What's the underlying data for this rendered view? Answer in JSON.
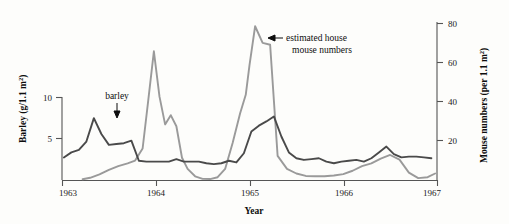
{
  "chart_data": {
    "type": "line",
    "title": "",
    "xlabel": "Year",
    "ylabel": "Barley (g/1.1 m2)",
    "ylabel_right": "Mouse numbers (per 1.1 m2)",
    "xlim": [
      1963.0,
      1967.0
    ],
    "ylim": [
      0,
      11
    ],
    "ylim_right": [
      0,
      88
    ],
    "grid": false,
    "legend": "none",
    "x_ticks": [
      "1963",
      "1964",
      "1965",
      "1966",
      "1967"
    ],
    "x_tick_values": [
      1963,
      1964,
      1965,
      1966,
      1967
    ],
    "y_ticks_left": [
      "5",
      "10"
    ],
    "y_tick_values_left": [
      5,
      10
    ],
    "y_ticks_right": [
      "20",
      "40",
      "60",
      "80"
    ],
    "y_tick_values_right": [
      20,
      40,
      60,
      80
    ],
    "series": [
      {
        "name": "barley",
        "axis": "left",
        "color": "#4a4a4a",
        "units": "g/1.1 m2",
        "x": [
          1963.02,
          1963.1,
          1963.18,
          1963.26,
          1963.34,
          1963.42,
          1963.5,
          1963.58,
          1963.66,
          1963.74,
          1963.82,
          1963.9,
          1963.98,
          1964.06,
          1964.14,
          1964.22,
          1964.3,
          1964.38,
          1964.46,
          1964.54,
          1964.62,
          1964.7,
          1964.78,
          1964.86,
          1964.94,
          1965.02,
          1965.1,
          1965.18,
          1965.26,
          1965.34,
          1965.42,
          1965.5,
          1965.58,
          1965.66,
          1965.74,
          1965.82,
          1965.9,
          1965.98,
          1966.06,
          1966.14,
          1966.22,
          1966.3,
          1966.38,
          1966.46,
          1966.54,
          1966.62,
          1966.7,
          1966.78,
          1966.86,
          1966.94
        ],
        "y": [
          2.7,
          3.3,
          3.6,
          4.6,
          7.4,
          5.5,
          4.2,
          4.3,
          4.4,
          4.7,
          2.3,
          2.2,
          2.2,
          2.2,
          2.2,
          2.5,
          2.2,
          2.2,
          2.2,
          2.0,
          1.9,
          2.0,
          2.3,
          2.1,
          3.2,
          5.8,
          6.5,
          7.0,
          7.6,
          5.2,
          3.3,
          2.6,
          2.4,
          2.5,
          2.6,
          2.2,
          2.0,
          2.2,
          2.3,
          2.4,
          2.2,
          2.6,
          3.3,
          4.0,
          3.1,
          2.7,
          2.8,
          2.8,
          2.7,
          2.6
        ]
      },
      {
        "name": "estimated house mouse numbers",
        "axis": "right",
        "color": "#9a9a9a",
        "units": "per 1.1 m2",
        "x": [
          1963.22,
          1963.3,
          1963.4,
          1963.5,
          1963.6,
          1963.7,
          1963.78,
          1963.86,
          1963.92,
          1963.98,
          1964.04,
          1964.1,
          1964.16,
          1964.22,
          1964.28,
          1964.34,
          1964.42,
          1964.5,
          1964.58,
          1964.66,
          1964.74,
          1964.82,
          1964.9,
          1964.96,
          1965.0,
          1965.06,
          1965.14,
          1965.22,
          1965.3,
          1965.4,
          1965.5,
          1965.6,
          1965.7,
          1965.8,
          1965.9,
          1966.0,
          1966.1,
          1966.2,
          1966.3,
          1966.4,
          1966.5,
          1966.6,
          1966.7,
          1966.8,
          1966.9,
          1966.98
        ],
        "y": [
          0.4,
          1.2,
          3.0,
          5.5,
          7.5,
          9.0,
          10.5,
          17.0,
          43.0,
          69.5,
          45.0,
          30.0,
          35.0,
          29.0,
          12.0,
          6.0,
          2.0,
          0.6,
          0.5,
          1.5,
          6.0,
          20.0,
          36.0,
          46.0,
          62.0,
          83.0,
          74.0,
          73.0,
          13.0,
          6.0,
          3.5,
          2.2,
          2.0,
          2.0,
          2.4,
          3.2,
          5.0,
          7.5,
          9.0,
          11.5,
          13.5,
          11.0,
          4.0,
          1.0,
          1.5,
          3.5
        ]
      }
    ],
    "annotations": [
      {
        "text": "barley",
        "target_series": "barley",
        "arrow": "down"
      },
      {
        "text_line1": "estimated house",
        "text_line2": "mouse numbers",
        "target_series": "estimated house mouse numbers",
        "arrow": "left"
      }
    ]
  }
}
